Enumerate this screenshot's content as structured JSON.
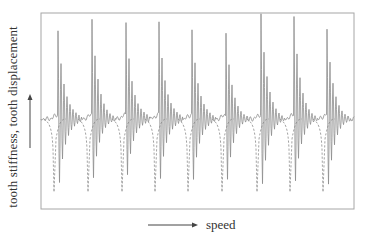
{
  "chart_data": {
    "type": "line",
    "title": "",
    "xlabel": "speed",
    "ylabel": "tooth stiffness, tooth displacement",
    "axis_ticks": "none",
    "grid": false,
    "legend": "none",
    "frame": {
      "left": 41,
      "top": 13,
      "right": 354,
      "bottom": 209,
      "baseline_y": 119
    },
    "series": [
      {
        "name": "tooth stiffness / dynamic response (solid, decaying oscillation bursts)",
        "style": "solid",
        "color": "#888888"
      },
      {
        "name": "tooth displacement (dashed dips)",
        "style": "dashed",
        "color": "#888888"
      }
    ],
    "bursts": {
      "count": 9,
      "peak_x": [
        58,
        92,
        126,
        159,
        192,
        226,
        261,
        294,
        327
      ],
      "peak_top_y": [
        30,
        20,
        22,
        21,
        29,
        34,
        14,
        17,
        30
      ],
      "trough_bottom_y": [
        200,
        192,
        190,
        195,
        196,
        194,
        200,
        196,
        200
      ],
      "dash_dip_y": 192
    },
    "colors": {
      "line": "#8c8c8c",
      "frame": "#a0a0a0",
      "text": "#333333"
    }
  },
  "labels": {
    "y_axis": "tooth stiffness, tooth displacement",
    "x_axis": "speed"
  }
}
